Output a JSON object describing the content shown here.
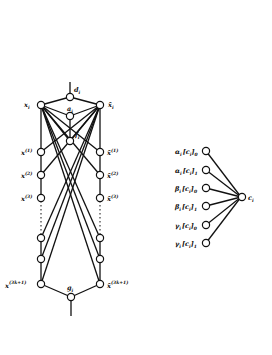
{
  "figure": {
    "left_diagram": {
      "labels": {
        "top": "d",
        "top_sub": "i",
        "x_left": "x",
        "x_left_sub": "i",
        "x_right": "x̄",
        "x_right_sub": "i",
        "mid_upper": "a",
        "mid_upper_sub": "i",
        "mid_lower": "f",
        "mid_lower_sub": "i",
        "left_1": "x",
        "left_1_sup": "(1)",
        "left_2": "x",
        "left_2_sup": "(2)",
        "left_3": "x",
        "left_3_sup": "(3)",
        "left_last": "x",
        "left_last_sup": "(3k+1)",
        "right_1": "x̄",
        "right_1_sup": "(1)",
        "right_2": "x̄",
        "right_2_sup": "(2)",
        "right_3": "x̄",
        "right_3_sup": "(3)",
        "right_last": "x̄",
        "right_last_sup": "(3k+1)",
        "bottom": "g",
        "bottom_sub": "i",
        "sub": "i"
      }
    },
    "right_diagram": {
      "hub_label": "c",
      "hub_sub": "i",
      "inputs": [
        "α_i [c_i]_0",
        "α_i [c_i]_1",
        "β_i [c_i]_0",
        "β_i [c_i]_1",
        "γ_i [c_i]_0",
        "γ_i [c_i]_1"
      ],
      "input_parts": [
        {
          "greek": "α",
          "sub": "i",
          "bracket": "[c",
          "bsub": "i",
          "close": "]",
          "idx": "0"
        },
        {
          "greek": "α",
          "sub": "i",
          "bracket": "[c",
          "bsub": "i",
          "close": "]",
          "idx": "1"
        },
        {
          "greek": "β",
          "sub": "i",
          "bracket": "[c",
          "bsub": "i",
          "close": "]",
          "idx": "0"
        },
        {
          "greek": "β",
          "sub": "i",
          "bracket": "[c",
          "bsub": "i",
          "close": "]",
          "idx": "1"
        },
        {
          "greek": "γ",
          "sub": "i",
          "bracket": "[c",
          "bsub": "i",
          "close": "]",
          "idx": "0"
        },
        {
          "greek": "γ",
          "sub": "i",
          "bracket": "[c",
          "bsub": "i",
          "close": "]",
          "idx": "1"
        }
      ]
    }
  }
}
